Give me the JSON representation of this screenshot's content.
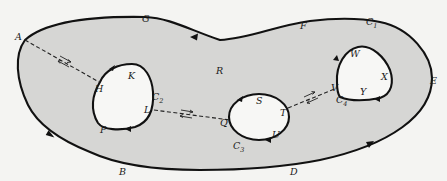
{
  "diagram": {
    "region_label": "R",
    "colors": {
      "background": "#f4f4f2",
      "region_fill": "#d6d6d4",
      "hole_fill": "#f7f7f5",
      "stroke": "#111111"
    },
    "outer_boundary": {
      "name": "C1",
      "points": {
        "A": "A",
        "G": "G",
        "F": "F",
        "C1": "C",
        "E": "E",
        "D": "D",
        "B": "B"
      },
      "subscript": "1"
    },
    "holes": [
      {
        "name": "C2",
        "label": "C",
        "subscript": "2",
        "points": [
          "H",
          "K",
          "L",
          "P"
        ]
      },
      {
        "name": "C3",
        "label": "C",
        "subscript": "3",
        "points": [
          "Q",
          "S",
          "T",
          "U"
        ]
      },
      {
        "name": "C4",
        "label": "C",
        "subscript": "4",
        "points": [
          "V",
          "W",
          "X",
          "Y"
        ]
      }
    ],
    "labels": {
      "A": "A",
      "G": "G",
      "F": "F",
      "C": "C",
      "E": "E",
      "D": "D",
      "B": "B",
      "R": "R",
      "H": "H",
      "K": "K",
      "L": "L",
      "P": "P",
      "Q": "Q",
      "S": "S",
      "T": "T",
      "U": "U",
      "V": "V",
      "W": "W",
      "X": "X",
      "Y": "Y",
      "sub1": "1",
      "sub2": "2",
      "sub3": "3",
      "sub4": "4"
    },
    "cross_cuts": [
      {
        "from": "A",
        "to": "H"
      },
      {
        "from": "L",
        "to": "Q"
      },
      {
        "from": "T",
        "to": "V"
      }
    ]
  }
}
